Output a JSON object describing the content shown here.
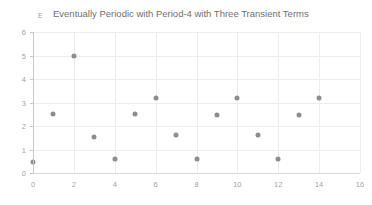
{
  "chart_data": {
    "type": "scatter",
    "title": "Eventually Periodic with Period-4 with Three Transient Terms",
    "series_key": "E",
    "xlabel": "",
    "ylabel": "",
    "xlim": [
      0,
      16
    ],
    "ylim": [
      0,
      6
    ],
    "xticks": [
      0,
      2,
      4,
      6,
      8,
      10,
      12,
      14,
      16
    ],
    "yticks": [
      0,
      1,
      2,
      3,
      4,
      5,
      6
    ],
    "xtick_labels": [
      "0",
      "2",
      "4",
      "6",
      "8",
      "10",
      "12",
      "14",
      "16"
    ],
    "ytick_labels": [
      "0",
      "1",
      "2",
      "3",
      "4",
      "5",
      "6"
    ],
    "grid": true,
    "legend": "none",
    "marker_color": "#8d8d8d",
    "grid_color": "#ececec",
    "axis_color": "#c9c9c9",
    "title_color": "#6f6f6f",
    "tick_label_color": "#a3a3a3",
    "x": [
      0,
      1,
      2,
      3,
      4,
      5,
      6,
      7,
      8,
      9,
      10,
      11,
      12,
      13,
      14
    ],
    "values": [
      0.45,
      2.5,
      5.0,
      1.55,
      0.6,
      2.5,
      3.2,
      1.6,
      0.6,
      2.45,
      3.2,
      1.6,
      0.6,
      2.45,
      3.2
    ],
    "points": [
      {
        "x": 0,
        "y": 0.45
      },
      {
        "x": 1,
        "y": 2.5
      },
      {
        "x": 2,
        "y": 5.0
      },
      {
        "x": 3,
        "y": 1.55
      },
      {
        "x": 4,
        "y": 0.6
      },
      {
        "x": 5,
        "y": 2.5
      },
      {
        "x": 6,
        "y": 3.2
      },
      {
        "x": 7,
        "y": 1.6
      },
      {
        "x": 8,
        "y": 0.6
      },
      {
        "x": 9,
        "y": 2.45
      },
      {
        "x": 10,
        "y": 3.2
      },
      {
        "x": 11,
        "y": 1.6
      },
      {
        "x": 12,
        "y": 0.6
      },
      {
        "x": 13,
        "y": 2.45
      },
      {
        "x": 14,
        "y": 3.2
      }
    ]
  }
}
